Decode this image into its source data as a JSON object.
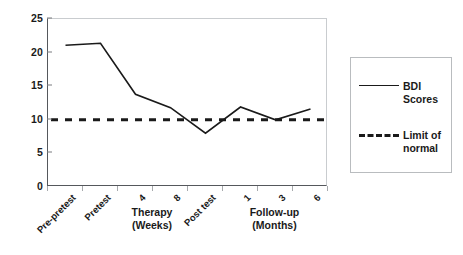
{
  "chart_data": {
    "type": "line",
    "title": "",
    "xlabel": "",
    "ylabel": "",
    "ylim": [
      0,
      25
    ],
    "yticks": [
      0,
      5,
      10,
      15,
      20,
      25
    ],
    "grid": false,
    "legend_position": "right",
    "categories": [
      "Pre-pretest",
      "Pretest",
      "4",
      "8",
      "Post test",
      "1",
      "3",
      "6"
    ],
    "category_groups": [
      {
        "label_line1": "Therapy",
        "label_line2": "(Weeks)",
        "categories": [
          "4",
          "8"
        ]
      },
      {
        "label_line1": "Follow-up",
        "label_line2": "(Months)",
        "categories": [
          "1",
          "3",
          "6"
        ]
      }
    ],
    "series": [
      {
        "name": "BDI Scores",
        "style": "solid",
        "values": [
          21.1,
          21.4,
          13.8,
          11.8,
          8.0,
          11.9,
          10.0,
          11.6
        ]
      },
      {
        "name": "Limit of normal",
        "style": "dashed",
        "values": [
          10,
          10,
          10,
          10,
          10,
          10,
          10,
          10
        ]
      }
    ],
    "annotations": []
  },
  "legend": {
    "entries": [
      {
        "label_line1": "BDI",
        "label_line2": "Scores",
        "style": "solid"
      },
      {
        "label_line1": "Limit of",
        "label_line2": "normal",
        "style": "dashed"
      }
    ]
  },
  "colors": {
    "series_line": "#1a1a1a",
    "limit_line": "#1a1a1a",
    "axis": "#55585c",
    "background": "#ffffff"
  }
}
